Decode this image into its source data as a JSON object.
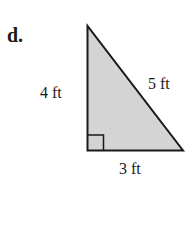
{
  "problem": {
    "part_label": "d.",
    "shape": "right-triangle",
    "sides": {
      "vertical": "4 ft",
      "hypotenuse": "5 ft",
      "base": "3 ft"
    },
    "right_angle_marker": true,
    "fill_color": "#d4d4d4",
    "stroke_color": "#1a1a1a"
  }
}
